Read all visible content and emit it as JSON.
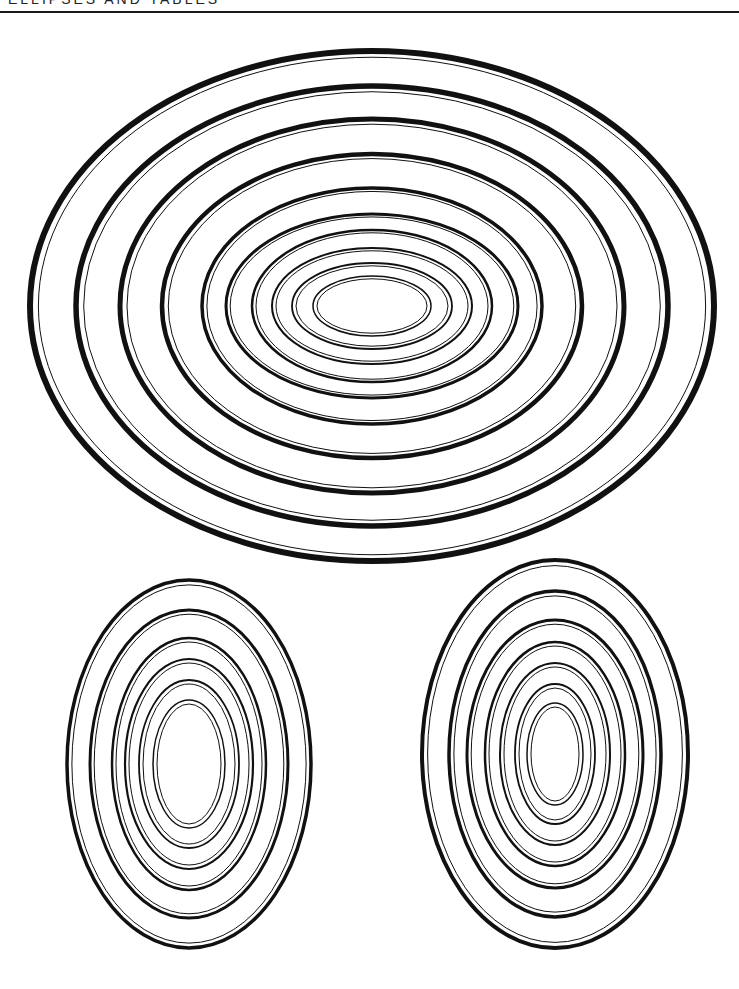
{
  "page": {
    "header_text": "ELLIPSES AND TABLES",
    "background": "#ffffff",
    "ink": "#111111"
  },
  "figures": [
    {
      "name": "large-horizontal-ellipse-set",
      "center": [
        372,
        306
      ],
      "rings": [
        {
          "rx": 342,
          "ry": 255,
          "stroke": 6
        },
        {
          "rx": 296,
          "ry": 220,
          "stroke": 5.5
        },
        {
          "rx": 252,
          "ry": 187,
          "stroke": 5
        },
        {
          "rx": 210,
          "ry": 152,
          "stroke": 4.5
        },
        {
          "rx": 170,
          "ry": 118,
          "stroke": 3.5
        },
        {
          "rx": 146,
          "ry": 92,
          "stroke": 3
        },
        {
          "rx": 120,
          "ry": 76,
          "stroke": 2.5
        },
        {
          "rx": 100,
          "ry": 58,
          "stroke": 2
        },
        {
          "rx": 80,
          "ry": 43,
          "stroke": 1.8
        },
        {
          "rx": 59,
          "ry": 30,
          "stroke": 1.5
        }
      ]
    },
    {
      "name": "bottom-left-vertical-ellipse-set",
      "center": [
        189,
        764
      ],
      "rings": [
        {
          "rx": 122,
          "ry": 184,
          "stroke": 3.5
        },
        {
          "rx": 99,
          "ry": 154,
          "stroke": 3
        },
        {
          "rx": 77,
          "ry": 126,
          "stroke": 2.5
        },
        {
          "rx": 64,
          "ry": 105,
          "stroke": 2.2
        },
        {
          "rx": 50,
          "ry": 84,
          "stroke": 1.8
        },
        {
          "rx": 36,
          "ry": 64,
          "stroke": 1.5
        }
      ]
    },
    {
      "name": "bottom-right-vertical-ellipse-set",
      "center": [
        555,
        754
      ],
      "rings": [
        {
          "rx": 133,
          "ry": 194,
          "stroke": 4
        },
        {
          "rx": 106,
          "ry": 163,
          "stroke": 3.5
        },
        {
          "rx": 88,
          "ry": 134,
          "stroke": 3
        },
        {
          "rx": 70,
          "ry": 112,
          "stroke": 2.5
        },
        {
          "rx": 55,
          "ry": 91,
          "stroke": 2
        },
        {
          "rx": 40,
          "ry": 70,
          "stroke": 1.8
        },
        {
          "rx": 28,
          "ry": 51,
          "stroke": 1.5
        }
      ]
    }
  ]
}
